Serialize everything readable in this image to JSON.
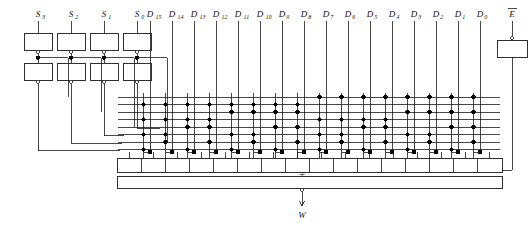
{
  "figure": {
    "line_color": "#1a1a1a",
    "dot_color": "#000000",
    "background": "#ffffff"
  },
  "select_inputs": {
    "labels": [
      "S",
      "S",
      "S",
      "S"
    ],
    "subs": [
      "3",
      "2",
      "1",
      "0"
    ],
    "names": [
      "S3",
      "S2",
      "S1",
      "S0"
    ],
    "count": 4,
    "buffer_stages": 2
  },
  "data_inputs": {
    "base": "D",
    "subs": [
      "15",
      "14",
      "13",
      "12",
      "11",
      "10",
      "9",
      "8",
      "7",
      "6",
      "5",
      "4",
      "3",
      "2",
      "1",
      "0"
    ],
    "names": [
      "D15",
      "D14",
      "D13",
      "D12",
      "D11",
      "D10",
      "D9",
      "D8",
      "D7",
      "D6",
      "D5",
      "D4",
      "D3",
      "D2",
      "D1",
      "D0"
    ],
    "count": 16
  },
  "enable_input": {
    "label": "E",
    "overbar": true,
    "name": "E-bar"
  },
  "output": {
    "label": "W",
    "name": "W",
    "inverted": true,
    "or_symbol": "+"
  },
  "matrix": {
    "and_rows": 8,
    "or_columns": 16,
    "dot_radius": 2.2,
    "description": "AND matrix of select true/complement lines crossing 16 product-term columns feeding an OR bar"
  },
  "and_dot_map": [
    [
      0,
      1,
      2,
      3,
      4,
      5,
      6,
      7,
      8,
      9,
      10,
      11,
      12,
      13,
      14,
      15
    ],
    [
      0,
      1,
      2,
      3,
      4,
      5,
      6,
      7,
      8,
      9,
      10,
      11,
      12,
      13,
      14,
      15
    ],
    [
      0,
      1,
      2,
      3,
      4,
      5,
      6,
      7,
      8,
      9,
      10,
      11,
      12,
      13,
      14,
      15
    ],
    [
      0,
      1,
      2,
      3,
      4,
      5,
      6,
      7,
      8,
      9,
      10,
      11,
      12,
      13,
      14,
      15
    ]
  ]
}
